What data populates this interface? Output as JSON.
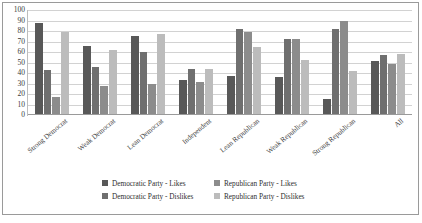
{
  "chart_data": {
    "type": "bar",
    "title": "",
    "xlabel": "",
    "ylabel": "",
    "ylim": [
      0,
      100
    ],
    "yticks": [
      0,
      10,
      20,
      30,
      40,
      50,
      60,
      70,
      80,
      90,
      100
    ],
    "grid": true,
    "legend_position": "bottom",
    "categories": [
      "Strong Democrat",
      "Weak Democrat",
      "Lean Democrat",
      "Independent",
      "Lean Republican",
      "Weak Republican",
      "Strong Republican",
      "All"
    ],
    "series": [
      {
        "name": "Democratic Party - Likes",
        "color": "#585858",
        "values": [
          88,
          66,
          75,
          33,
          37,
          36,
          15,
          51
        ]
      },
      {
        "name": "Democratic Party - Dislikes",
        "color": "#6f6f6f",
        "values": [
          43,
          46,
          60,
          44,
          82,
          72,
          82,
          57
        ]
      },
      {
        "name": "Republican Party - Likes",
        "color": "#8c8c8c",
        "values": [
          17,
          28,
          30,
          31,
          79,
          72,
          90,
          49
        ]
      },
      {
        "name": "Republican Party - Dislikes",
        "color": "#bcbcbc",
        "values": [
          79,
          62,
          77,
          44,
          65,
          52,
          42,
          58
        ]
      }
    ]
  },
  "legend": {
    "items": [
      {
        "label": "Democratic Party - Likes",
        "color": "#585858"
      },
      {
        "label": "Democratic Party - Dislikes",
        "color": "#6f6f6f"
      },
      {
        "label": "Republican Party - Likes",
        "color": "#8c8c8c"
      },
      {
        "label": "Republican Party - Dislikes",
        "color": "#bcbcbc"
      }
    ]
  }
}
